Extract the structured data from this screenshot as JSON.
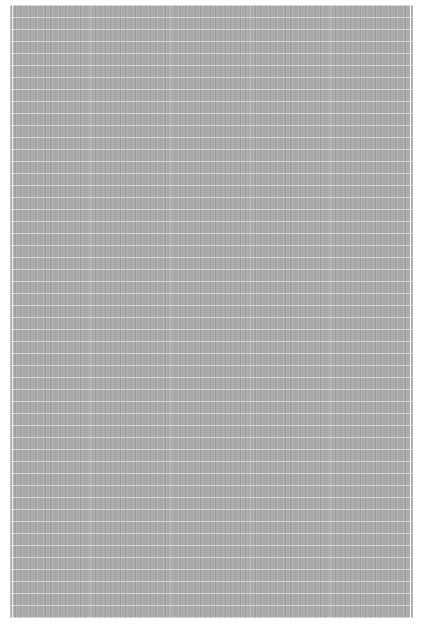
{
  "image": {
    "description": "gray noisy texture with faint white grid lines",
    "colors": {
      "background": "#ffffff",
      "texture": "#a9a9a9",
      "gridlines": "#ffffff"
    }
  }
}
